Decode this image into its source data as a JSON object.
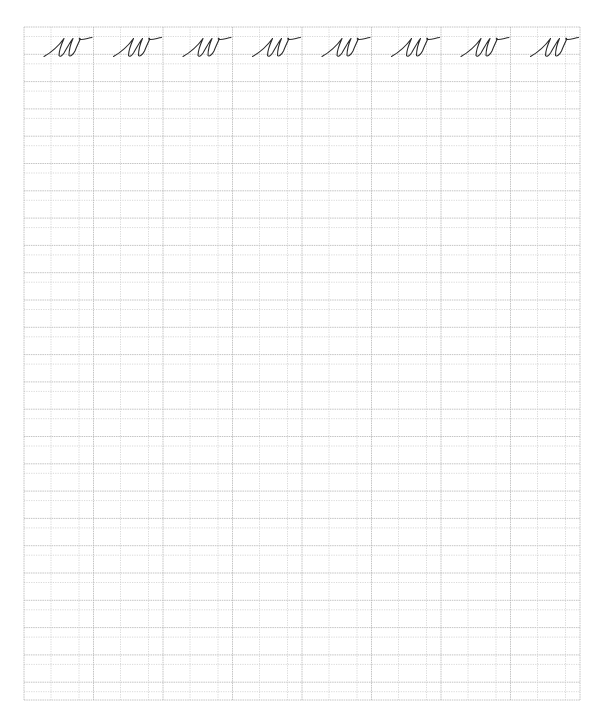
{
  "worksheet": {
    "title": "cursive w practice",
    "letter": "w",
    "style": "cursive",
    "columns": 8,
    "examples_row": 1,
    "practice_rows": 25,
    "example_glyphs": [
      "w",
      "w",
      "w",
      "w",
      "w",
      "w",
      "w",
      "w"
    ],
    "grid": {
      "left": 24,
      "top": 27,
      "right": 580,
      "bottom": 700,
      "column_width": 69.5,
      "inner_guides": [
        27,
        55
      ],
      "row_unit": 27.3,
      "row_guide_offset": 9.5
    },
    "colors": {
      "background": "#ffffff",
      "grid_major": "#b5b5b5",
      "grid_minor": "#cfcfcf",
      "ink": "#2b2b2b"
    }
  }
}
